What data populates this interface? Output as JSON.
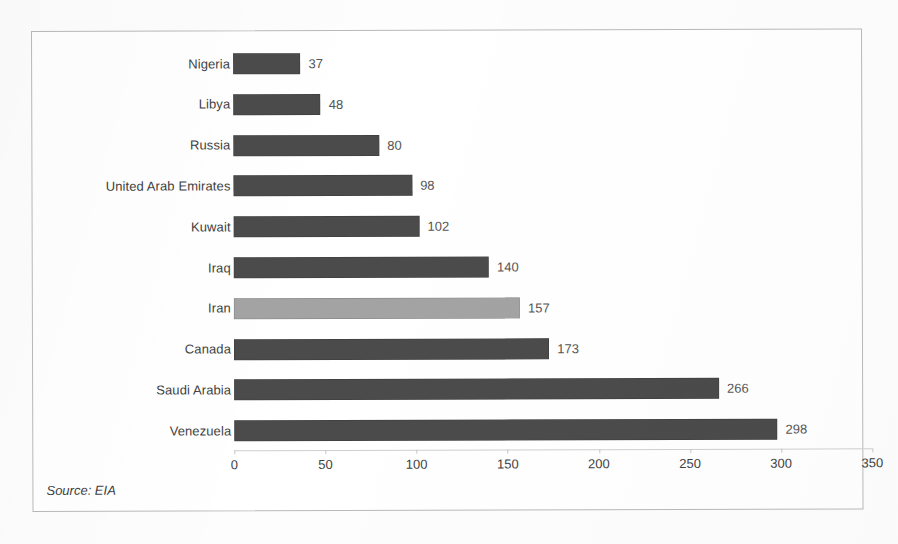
{
  "chart_data": {
    "type": "bar",
    "orientation": "horizontal",
    "title": "",
    "xlabel": "",
    "ylabel": "",
    "xlim": [
      0,
      350
    ],
    "xticks": [
      "0",
      "50",
      "100",
      "150",
      "200",
      "250",
      "300",
      "350"
    ],
    "grid": false,
    "legend": null,
    "categories": [
      "Nigeria",
      "Libya",
      "Russia",
      "United Arab Emirates",
      "Kuwait",
      "Iraq",
      "Iran",
      "Canada",
      "Saudi Arabia",
      "Venezuela"
    ],
    "values": [
      37,
      48,
      80,
      98,
      102,
      140,
      173,
      173,
      266,
      298
    ],
    "bars": [
      {
        "category": "Nigeria",
        "value": 37,
        "value_label": "37",
        "highlight": false
      },
      {
        "category": "Libya",
        "value": 48,
        "value_label": "48",
        "highlight": false
      },
      {
        "category": "Russia",
        "value": 80,
        "value_label": "80",
        "highlight": false
      },
      {
        "category": "United Arab Emirates",
        "value": 98,
        "value_label": "98",
        "highlight": false
      },
      {
        "category": "Kuwait",
        "value": 102,
        "value_label": "102",
        "highlight": false
      },
      {
        "category": "Iraq",
        "value": 140,
        "value_label": "140",
        "highlight": false
      },
      {
        "category": "Iran",
        "value": 157,
        "value_label": "157",
        "highlight": true
      },
      {
        "category": "Canada",
        "value": 173,
        "value_label": "173",
        "highlight": false
      },
      {
        "category": "Saudi Arabia",
        "value": 266,
        "value_label": "266",
        "highlight": false
      },
      {
        "category": "Venezuela",
        "value": 298,
        "value_label": "298",
        "highlight": false
      }
    ],
    "annotations": [
      {
        "name": "source-note",
        "text": "Source: EIA"
      }
    ],
    "colors": {
      "bar": "#4b4b4b",
      "bar_highlight": "#a3a3a3",
      "label_text": "#3f3f3f",
      "value_text": "#555555",
      "axis_line": "#cfcfcf",
      "frame": "#b9b9b9",
      "background": "#ffffff"
    }
  },
  "source": {
    "text": "Source: EIA"
  }
}
